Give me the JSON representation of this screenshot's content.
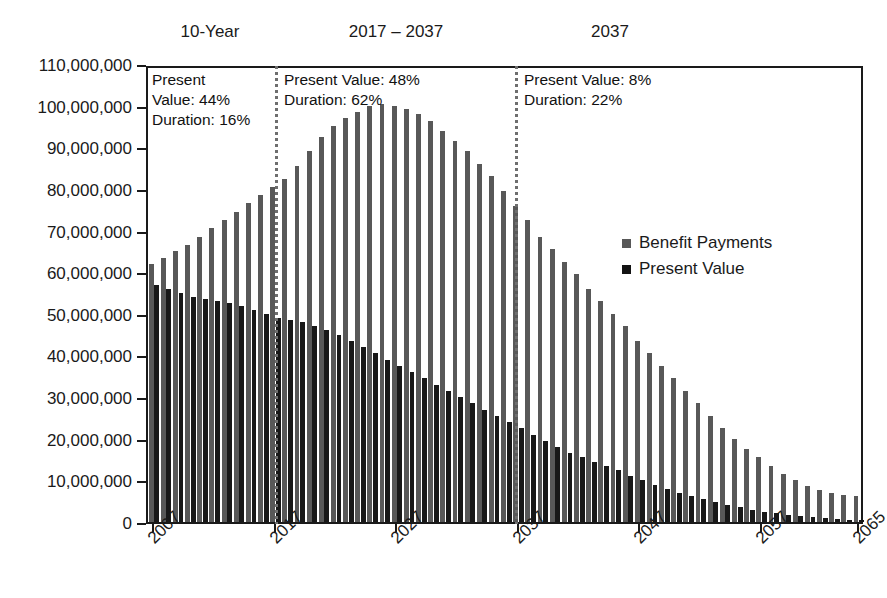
{
  "section_headers": [
    {
      "label": "10-Year",
      "x": 210
    },
    {
      "label": "2017 – 2037",
      "x": 396
    },
    {
      "label": "2037",
      "x": 610
    }
  ],
  "annotations": [
    {
      "name": "annotation-10-year",
      "text": "Present\nValue: 44%\nDuration: 16%",
      "x": 152,
      "y": 70
    },
    {
      "name": "annotation-2017-2037",
      "text": "Present Value: 48%\nDuration: 62%",
      "x": 284,
      "y": 70
    },
    {
      "name": "annotation-2037",
      "text": "Present Value: 8%\nDuration: 22%",
      "x": 524,
      "y": 70
    }
  ],
  "dividers": [
    {
      "name": "divider-2017",
      "x": 275
    },
    {
      "name": "divider-2037",
      "x": 515
    }
  ],
  "legend": {
    "items": [
      {
        "label": "Benefit Payments",
        "series": "benefit_payments",
        "color": "#585858"
      },
      {
        "label": "Present Value",
        "series": "present_value",
        "color": "#131313"
      }
    ]
  },
  "chart_data": {
    "type": "bar",
    "title": "",
    "xlabel": "",
    "ylabel": "",
    "ylim": [
      0,
      110000000
    ],
    "ytick_step": 10000000,
    "ytick_labels": [
      "110,000,000",
      "100,000,000",
      "90,000,000",
      "80,000,000",
      "70,000,000",
      "60,000,000",
      "50,000,000",
      "40,000,000",
      "30,000,000",
      "20,000,000",
      "10,000,000",
      "0"
    ],
    "ytick_values": [
      110000000,
      100000000,
      90000000,
      80000000,
      70000000,
      60000000,
      50000000,
      40000000,
      30000000,
      20000000,
      10000000,
      0
    ],
    "xtick_labels": [
      "2007",
      "2017",
      "2027",
      "2037",
      "2047",
      "2057",
      "2065"
    ],
    "xtick_years": [
      2007,
      2017,
      2027,
      2037,
      2047,
      2057,
      2065
    ],
    "grid": false,
    "legend_position": "inside-right",
    "categories": [
      2007,
      2008,
      2009,
      2010,
      2011,
      2012,
      2013,
      2014,
      2015,
      2016,
      2017,
      2018,
      2019,
      2020,
      2021,
      2022,
      2023,
      2024,
      2025,
      2026,
      2027,
      2028,
      2029,
      2030,
      2031,
      2032,
      2033,
      2034,
      2035,
      2036,
      2037,
      2038,
      2039,
      2040,
      2041,
      2042,
      2043,
      2044,
      2045,
      2046,
      2047,
      2048,
      2049,
      2050,
      2051,
      2052,
      2053,
      2054,
      2055,
      2056,
      2057,
      2058,
      2059,
      2060,
      2061,
      2062,
      2063,
      2064,
      2065
    ],
    "series": [
      {
        "name": "Benefit Payments",
        "color": "#585858",
        "values": [
          62000000,
          63500000,
          65000000,
          66500000,
          68500000,
          70500000,
          72500000,
          74500000,
          76500000,
          78500000,
          80500000,
          82500000,
          85500000,
          89000000,
          92500000,
          95000000,
          97000000,
          98500000,
          99800000,
          100300000,
          100000000,
          99300000,
          98000000,
          96300000,
          94000000,
          91500000,
          89000000,
          86000000,
          83000000,
          79500000,
          76000000,
          72500000,
          68500000,
          65500000,
          62500000,
          59500000,
          56000000,
          53000000,
          50000000,
          47000000,
          43500000,
          40500000,
          37500000,
          34500000,
          31500000,
          28500000,
          25500000,
          22500000,
          20000000,
          17500000,
          15500000,
          13500000,
          11500000,
          10000000,
          8700000,
          7700000,
          7000000,
          6500000,
          6200000
        ]
      },
      {
        "name": "Present Value",
        "color": "#131313",
        "values": [
          57000000,
          56000000,
          55000000,
          54000000,
          53500000,
          53000000,
          52500000,
          52000000,
          51000000,
          50000000,
          49000000,
          48500000,
          48000000,
          47000000,
          46000000,
          45000000,
          43500000,
          42000000,
          40500000,
          39000000,
          37500000,
          36000000,
          34500000,
          33000000,
          31500000,
          30000000,
          28500000,
          27000000,
          25500000,
          24000000,
          22500000,
          21000000,
          19500000,
          18000000,
          16500000,
          15500000,
          14500000,
          13500000,
          12500000,
          11000000,
          10000000,
          9000000,
          8000000,
          7000000,
          6200000,
          5500000,
          4800000,
          4200000,
          3600000,
          3000000,
          2500000,
          2100000,
          1700000,
          1400000,
          1100000,
          900000,
          700000,
          550000,
          450000
        ]
      }
    ]
  }
}
